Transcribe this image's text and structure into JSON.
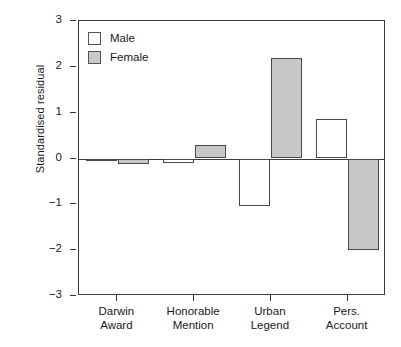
{
  "chart_data": {
    "type": "bar",
    "title": "",
    "subtitle": "",
    "xlabel": "",
    "ylabel": "Standardised residual",
    "categories": [
      "Darwin Award",
      "Honorable Mention",
      "Urban Legend",
      "Pers. Account"
    ],
    "category_lines": [
      [
        "Darwin",
        "Award"
      ],
      [
        "Honorable",
        "Mention"
      ],
      [
        "Urban",
        "Legend"
      ],
      [
        "Pers.",
        "Account"
      ]
    ],
    "series": [
      {
        "name": "Male",
        "color": "#ffffff",
        "values": [
          -0.02,
          -0.1,
          -1.04,
          0.86
        ]
      },
      {
        "name": "Female",
        "color": "#c8c8c8",
        "values": [
          -0.12,
          0.29,
          2.2,
          -2.0
        ]
      }
    ],
    "ylim": [
      -3,
      3
    ],
    "yticks": [
      3,
      2,
      1,
      0,
      -1,
      -2,
      -3
    ],
    "ytick_labels": [
      "3",
      "2",
      "1",
      "0",
      "−1",
      "−2",
      "−3"
    ],
    "grid": false,
    "legend_position": "top-left",
    "legend": [
      "Male",
      "Female"
    ],
    "zero_reference_line": 0
  },
  "axes": {
    "y_title": "Standardised residual"
  },
  "legend": {
    "entries": [
      {
        "label": "Male",
        "swatch": "male"
      },
      {
        "label": "Female",
        "swatch": "female"
      }
    ]
  }
}
